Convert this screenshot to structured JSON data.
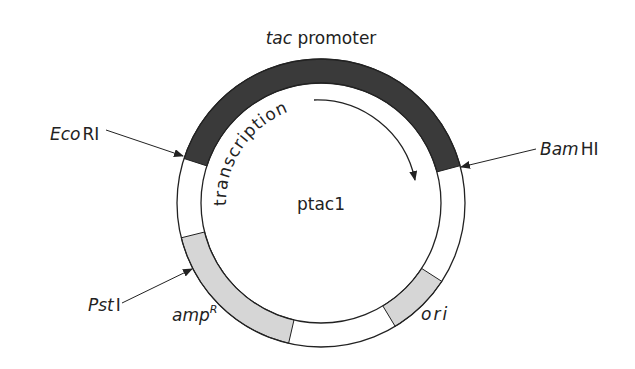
{
  "diagram": {
    "type": "plasmid-map",
    "plasmid_name": "ptac1",
    "colors": {
      "promoter_fill": "#3a3a3a",
      "gene_fill": "#d6d6d6",
      "backbone_fill": "#ffffff",
      "stroke": "#222222"
    },
    "labels": {
      "promoter_italic": "tac",
      "promoter_rest": " promoter",
      "transcription": "transcription",
      "ecori_italic": "Eco",
      "ecori_rest": "RI",
      "bamhi_italic": "Bam",
      "bamhi_rest": "HI",
      "psti_italic": "Pst",
      "psti_rest": "I",
      "amp": "amp",
      "amp_sup": "R",
      "ori": "ori"
    },
    "segments": [
      {
        "name": "tac promoter",
        "start_deg": 198,
        "end_deg": 345,
        "fill": "dark"
      },
      {
        "name": "ori",
        "start_deg": 33,
        "end_deg": 59,
        "fill": "light"
      },
      {
        "name": "ampR",
        "start_deg": 103,
        "end_deg": 166,
        "fill": "light"
      }
    ],
    "sites": [
      "EcoRI",
      "BamHI",
      "PstI"
    ]
  }
}
